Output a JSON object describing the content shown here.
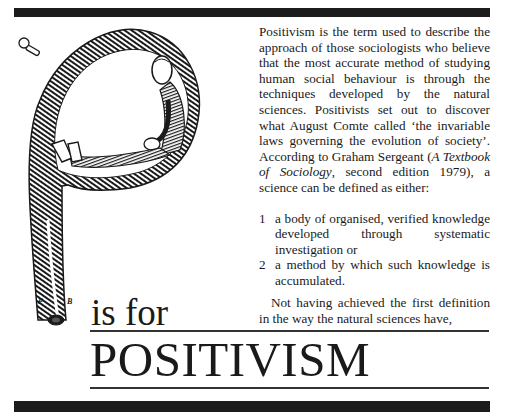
{
  "layout": {
    "bar_color": "#1c1c1c",
    "ink_color": "#1a1a1a"
  },
  "illustration": {
    "description": "Engraved letter P shaped as a curled tube with a seated man inside its bowl, a small tap/valve on the left",
    "initials": {
      "left": "P",
      "right": "B"
    }
  },
  "heading": {
    "prefix": "is for",
    "title": "POSITIVISM"
  },
  "body": {
    "para1_part1": "Positivism is the term used to describe the approach of those sociologists who believe that the most accurate method of studying human social behaviour is through the techniques developed by the natural sciences. Positivists set out to discover what August Comte called ‘the invariable laws governing the evolution of society’. According to Graham Sergeant (",
    "para1_book_title": "A Textbook of Sociology",
    "para1_part2": ", second edition 1979), a science can be defined as either:",
    "list": [
      {
        "num": "1",
        "text": "a body of organised, verified knowledge developed through systematic investigation or"
      },
      {
        "num": "2",
        "text": "a method by which such knowledge is accumulated."
      }
    ],
    "para2": "Not having achieved the first definition in the way the natural sciences have,"
  }
}
